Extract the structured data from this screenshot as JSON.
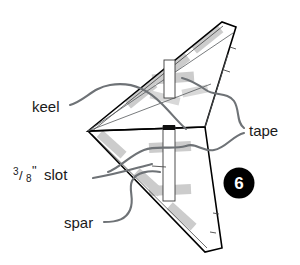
{
  "figure": {
    "step_badge": {
      "number": "6",
      "background_color": "#000000",
      "text_color": "#ffffff"
    },
    "colors": {
      "background": "#ffffff",
      "outline": "#000000",
      "fold_line": "#55595c",
      "leader_line": "#6e7276",
      "tape": "#cccccc",
      "text": "#1a1a1a"
    }
  },
  "labels": {
    "keel": "keel",
    "slot_fraction_numerator": "3",
    "slot_fraction_denominator": "8",
    "slot_fraction_slash": "/",
    "slot_unit": "\"",
    "slot_word": "slot",
    "spar": "spar",
    "tape": "tape"
  },
  "parts": [
    {
      "name": "keel",
      "label": "keel"
    },
    {
      "name": "slot",
      "label": "3/8\" slot"
    },
    {
      "name": "spar",
      "label": "spar"
    },
    {
      "name": "tape",
      "label": "tape"
    }
  ]
}
